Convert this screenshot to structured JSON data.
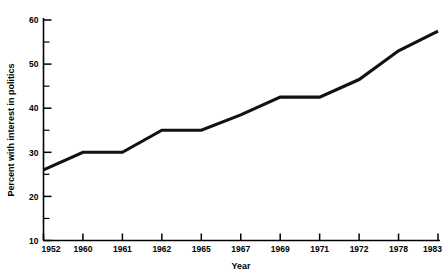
{
  "chart_data": {
    "type": "line",
    "title": "",
    "xlabel": "Year",
    "ylabel": "Percent with interest in politics",
    "categories": [
      "1952",
      "1960",
      "1961",
      "1962",
      "1965",
      "1967",
      "1969",
      "1971",
      "1972",
      "1978",
      "1983"
    ],
    "values": [
      26,
      30,
      30,
      35,
      35,
      38.5,
      42.5,
      42.5,
      46.5,
      53,
      57.5
    ],
    "series": [
      {
        "name": "Percent with interest in politics",
        "values": [
          26,
          30,
          30,
          35,
          35,
          38.5,
          42.5,
          42.5,
          46.5,
          53,
          57.5
        ]
      }
    ],
    "ylim": [
      10,
      60
    ],
    "y_major_ticks": [
      "10",
      "20",
      "30",
      "40",
      "50",
      "60"
    ],
    "y_minor_ticks": [
      "15",
      "25",
      "35",
      "45",
      "55"
    ],
    "x_tick_labels": [
      "1952",
      "1960",
      "1961",
      "1962",
      "1965",
      "1967",
      "1969",
      "1971",
      "1972",
      "1978",
      "1983"
    ],
    "grid": false,
    "legend": "none",
    "line_color": "#111111",
    "background_color": "#ffffff"
  }
}
